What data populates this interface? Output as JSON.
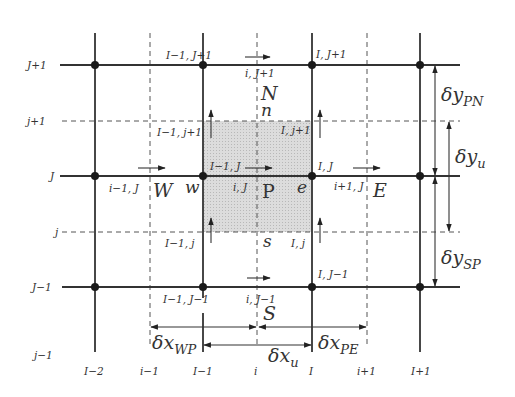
{
  "figure": {
    "row_labels_solid": [
      {
        "id": "J+1",
        "label": "J+1",
        "y": 65
      },
      {
        "id": "J",
        "label": "J",
        "y": 176
      },
      {
        "id": "J-1",
        "label": "J−1",
        "y": 287
      }
    ],
    "row_labels_dashed": [
      {
        "id": "j+1",
        "label": "j+1",
        "y": 121
      },
      {
        "id": "j",
        "label": "j",
        "y": 232
      },
      {
        "id": "j-1",
        "label": "j−1",
        "y": 355
      }
    ],
    "column_labels": {
      "I-2": "I−2",
      "i-1": "i−1",
      "I-1": "I−1",
      "i": "i",
      "I": "I",
      "i+1": "i+1",
      "I+1": "I+1"
    },
    "node_labels": {
      "I-1_J+1": "I−1, J+1",
      "I_J+1": "I, J+1",
      "i_J+1": "i, J+1",
      "I-1_j+1": "I−1, j+1",
      "I_j+1": "I, j+1",
      "I-1_J": "I−1, J",
      "I_J": "I, J",
      "i-1_J": "i−1, J",
      "i_J": "i, J",
      "i+1_J": "i+1, J",
      "I-1_j": "I−1, j",
      "I_j": "I, j",
      "I-1_J-1": "I−1, J−1",
      "I_J-1": "I, J−1",
      "i_J-1": "i, J−1"
    },
    "compass_labels": {
      "N": "N",
      "n": "n",
      "W": "W",
      "w": "w",
      "P": "P",
      "e": "e",
      "E": "E",
      "s": "s",
      "S": "S"
    },
    "dimensions": {
      "dx_WP": {
        "base": "δx",
        "sub": "WP"
      },
      "dx_u": {
        "base": "δx",
        "sub": "u"
      },
      "dx_PE": {
        "base": "δx",
        "sub": "PE"
      },
      "dy_PN": {
        "base": "δy",
        "sub": "PN"
      },
      "dy_u": {
        "base": "δy",
        "sub": "u"
      },
      "dy_SP": {
        "base": "δy",
        "sub": "SP"
      }
    },
    "colors": {
      "grid_line": "#333333",
      "dashed_line": "#555555",
      "control_volume_fill": "#d4d4d4",
      "background": "#ffffff"
    }
  }
}
